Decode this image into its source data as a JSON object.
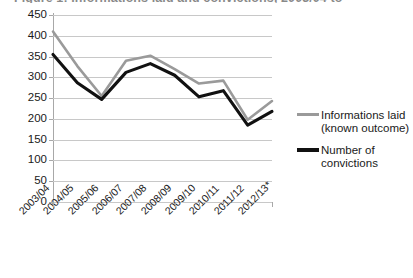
{
  "chart_data": {
    "type": "line",
    "title": "Figure 1: Informations laid and convictions, 2003/04 to 2012/13",
    "xlabel": "",
    "ylabel": "",
    "ylim": [
      0,
      450
    ],
    "ytick_step": 50,
    "yticks": [
      "450",
      "400",
      "350",
      "300",
      "250",
      "200",
      "150",
      "100",
      "50",
      "0"
    ],
    "grid": true,
    "legend_position": "right",
    "categories": [
      "2003/04",
      "2004/05",
      "2005/06",
      "2006/07",
      "2007/08",
      "2008/09",
      "2009/10",
      "2010/11",
      "2011/12",
      "2012/13*"
    ],
    "series": [
      {
        "name": "Informations laid (known outcome)",
        "color": "#9a9a9a",
        "values": [
          410,
          327,
          255,
          340,
          352,
          320,
          285,
          292,
          198,
          243
        ]
      },
      {
        "name": "Number of convictions",
        "color": "#111111",
        "values": [
          355,
          287,
          247,
          312,
          333,
          305,
          253,
          268,
          185,
          218
        ]
      }
    ]
  },
  "legend": {
    "entries": [
      {
        "label": "Informations laid (known outcome)",
        "swatch": "gray"
      },
      {
        "label": "Number of convictions",
        "swatch": "black"
      }
    ]
  }
}
